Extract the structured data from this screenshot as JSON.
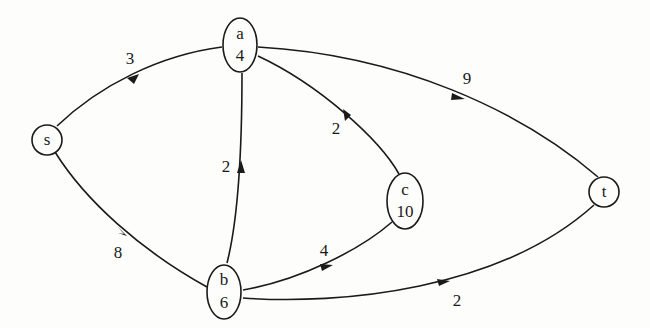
{
  "diagram": {
    "type": "directed weighted graph",
    "nodes": [
      {
        "id": "s",
        "label": "s",
        "value": ""
      },
      {
        "id": "a",
        "label": "a",
        "value": "4"
      },
      {
        "id": "b",
        "label": "b",
        "value": "6"
      },
      {
        "id": "c",
        "label": "c",
        "value": "10"
      },
      {
        "id": "t",
        "label": "t",
        "value": ""
      }
    ],
    "edges": [
      {
        "from": "s",
        "to": "a",
        "weight": "3"
      },
      {
        "from": "s",
        "to": "b",
        "weight": "8"
      },
      {
        "from": "b",
        "to": "a",
        "weight": "2"
      },
      {
        "from": "c",
        "to": "a",
        "weight": "2"
      },
      {
        "from": "b",
        "to": "c",
        "weight": "4"
      },
      {
        "from": "a",
        "to": "t",
        "weight": "9"
      },
      {
        "from": "b",
        "to": "t",
        "weight": "2"
      }
    ]
  }
}
